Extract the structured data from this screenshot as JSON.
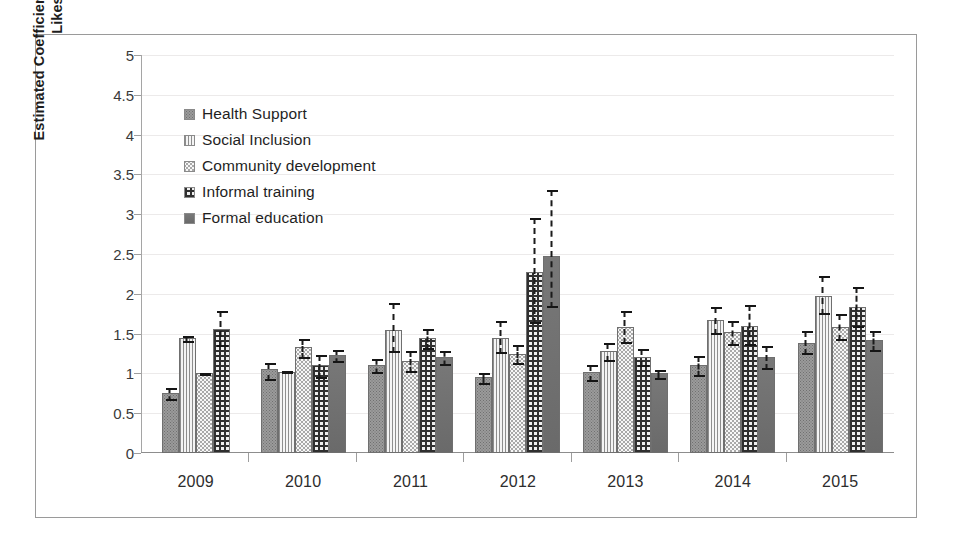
{
  "chart_data": {
    "type": "bar",
    "title": "",
    "xlabel": "",
    "ylabel": "Estimated Coefficient of Variance of Likes",
    "ylim": [
      0,
      5
    ],
    "yticks": [
      "0",
      "0.5",
      "1",
      "1.5",
      "2",
      "2.5",
      "3",
      "3.5",
      "4",
      "4.5",
      "5"
    ],
    "grid": true,
    "legend_position": "top-left",
    "error_bars": true,
    "categories": [
      "2009",
      "2010",
      "2011",
      "2012",
      "2013",
      "2014",
      "2015"
    ],
    "series": [
      {
        "name": "Health Support",
        "pattern": "dense-dots-gray",
        "values": [
          0.75,
          1.05,
          1.1,
          0.95,
          1.02,
          1.1,
          1.38
        ],
        "err_low": [
          0.09,
          0.14,
          0.1,
          0.08,
          0.12,
          0.13,
          0.14
        ],
        "err_high": [
          0.08,
          0.1,
          0.1,
          0.07,
          0.1,
          0.13,
          0.17
        ]
      },
      {
        "name": "Social Inclusion",
        "pattern": "vertical-lines",
        "values": [
          1.44,
          1.02,
          1.55,
          1.45,
          1.28,
          1.67,
          1.97
        ],
        "err_low": [
          0.05,
          0.02,
          0.28,
          0.2,
          0.12,
          0.18,
          0.22
        ],
        "err_high": [
          0.05,
          0.02,
          0.35,
          0.22,
          0.12,
          0.18,
          0.27
        ]
      },
      {
        "name": "Community development",
        "pattern": "light-dots",
        "values": [
          1.0,
          1.33,
          1.16,
          1.25,
          1.58,
          1.52,
          1.58
        ],
        "err_low": [
          0.02,
          0.14,
          0.14,
          0.14,
          0.2,
          0.16,
          0.16
        ],
        "err_high": [
          0.02,
          0.12,
          0.14,
          0.12,
          0.22,
          0.16,
          0.18
        ]
      },
      {
        "name": "Informal training",
        "pattern": "crosshatch-grid",
        "values": [
          1.56,
          1.11,
          1.44,
          2.27,
          1.2,
          1.6,
          1.83
        ],
        "err_low": [
          0.22,
          0.17,
          0.13,
          0.65,
          0.11,
          0.25,
          0.25
        ],
        "err_high": [
          0.24,
          0.14,
          0.13,
          0.7,
          0.12,
          0.28,
          0.27
        ]
      },
      {
        "name": "Formal education",
        "pattern": "solid-dark-gray",
        "values": [
          null,
          1.23,
          1.2,
          2.48,
          1.0,
          1.21,
          1.42
        ],
        "err_low": [
          null,
          0.09,
          0.1,
          0.65,
          0.07,
          0.16,
          0.14
        ],
        "err_high": [
          null,
          0.08,
          0.1,
          0.85,
          0.06,
          0.15,
          0.13
        ]
      }
    ]
  },
  "legend": {
    "items": [
      {
        "label": "Health Support",
        "swatch": "health-support-swatch"
      },
      {
        "label": "Social Inclusion",
        "swatch": "social-inclusion-swatch"
      },
      {
        "label": "Community development",
        "swatch": "community-development-swatch"
      },
      {
        "label": "Informal training",
        "swatch": "informal-training-swatch"
      },
      {
        "label": "Formal education",
        "swatch": "formal-education-swatch"
      }
    ]
  },
  "axes": {
    "y_title": "Estimated Coefficient of Variance of Likes",
    "y_ticks": [
      "5",
      "4.5",
      "4",
      "3.5",
      "3",
      "2.5",
      "2",
      "1.5",
      "1",
      "0.5",
      "0"
    ],
    "x_ticks": [
      "2009",
      "2010",
      "2011",
      "2012",
      "2013",
      "2014",
      "2015"
    ]
  }
}
